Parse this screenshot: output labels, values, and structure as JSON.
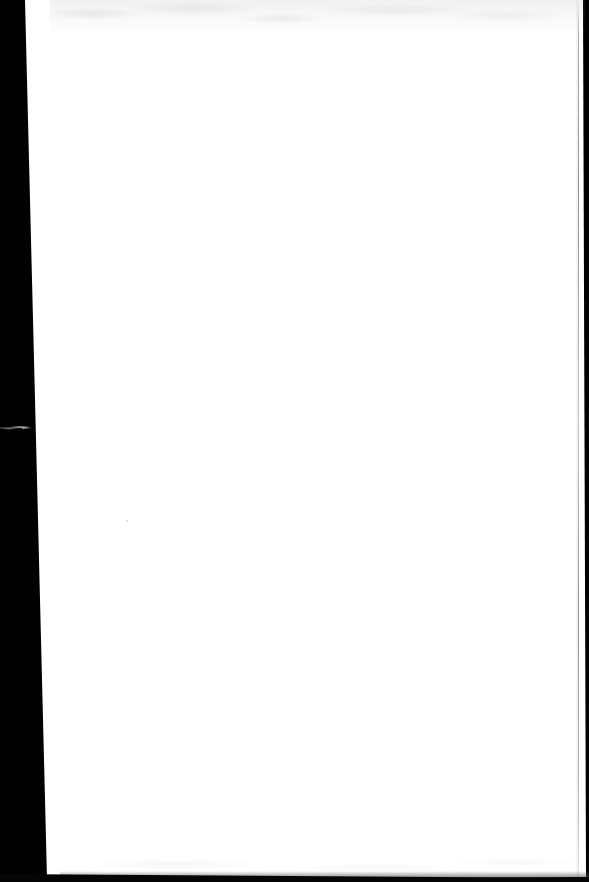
{
  "document": {
    "kind": "scanned-page",
    "page_state": "blank",
    "page_text": "",
    "caption": "Blank scanned page",
    "dimensions": {
      "width_px": 589,
      "height_px": 882
    }
  },
  "scan": {
    "backdrop_color": "#010101",
    "paper_color": "#ffffff",
    "edge_line_color": "#3c3c3e",
    "bottom_band_color": "#050505",
    "artifact_color": "#d7d9dc",
    "speck_color": "#cdcfd2",
    "noise_color": "#969ba2"
  },
  "geometry": {
    "paper_corners": {
      "top_left_x": 25,
      "top_right_x": 583,
      "bottom_right_x": 586,
      "bottom_left_x": 47,
      "top_y": 0,
      "bottom_y": 878
    },
    "left_band_width_top_px": 25,
    "left_band_width_bottom_px": 47,
    "right_edge_line_x": 578,
    "bottom_band_top_y": 874
  },
  "artifacts": {
    "wisp": {
      "label": "light streak artifact",
      "x": 0,
      "y": 424,
      "width": 29,
      "height": 7
    },
    "speck": {
      "label": "dust speck",
      "x": 126,
      "y": 520
    }
  }
}
